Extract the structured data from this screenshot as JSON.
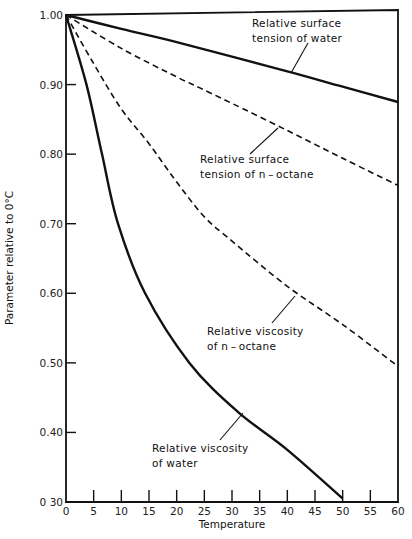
{
  "chart_data": {
    "type": "line",
    "title": "",
    "xlabel": "Temperature",
    "ylabel": "Parameter relative to 0°C",
    "xlim": [
      0,
      60
    ],
    "ylim": [
      0.3,
      1.0
    ],
    "grid": false,
    "legend": "none (curves labeled by inline annotations with leader lines)",
    "x_ticks": [
      "0",
      "5",
      "10",
      "15",
      "20",
      "25",
      "30",
      "35",
      "40",
      "45",
      "50",
      "55",
      "60"
    ],
    "y_ticks": [
      "1.00",
      "0.90",
      "0.80",
      "0.70",
      "0.60",
      "0.50",
      "0.40",
      "0 30"
    ],
    "series": [
      {
        "name": "Relative surface tension of water",
        "style": "solid",
        "x": [
          0,
          10,
          20,
          30,
          40,
          50,
          60
        ],
        "y": [
          1.0,
          0.98,
          0.961,
          0.94,
          0.919,
          0.897,
          0.875
        ]
      },
      {
        "name": "Relative surface tension of n-octane",
        "style": "dashed",
        "x": [
          0,
          10,
          20,
          24,
          30,
          40,
          50,
          60
        ],
        "y": [
          1.0,
          0.952,
          0.911,
          0.896,
          0.873,
          0.834,
          0.794,
          0.755
        ]
      },
      {
        "name": "Relative viscosity of n-octane",
        "style": "dashed",
        "x": [
          0,
          5,
          10,
          15,
          20,
          25,
          30,
          40,
          50,
          60
        ],
        "y": [
          1.0,
          0.93,
          0.865,
          0.815,
          0.76,
          0.71,
          0.675,
          0.61,
          0.555,
          0.495
        ]
      },
      {
        "name": "Relative viscosity of water",
        "style": "solid",
        "x": [
          0,
          3.7,
          6.5,
          9.4,
          14.3,
          22.3,
          31,
          40,
          50
        ],
        "y": [
          1.0,
          0.9,
          0.8,
          0.7,
          0.6,
          0.5,
          0.43,
          0.375,
          0.305
        ]
      }
    ],
    "annotations": [
      {
        "lines": [
          "Relative  surface",
          "tension  of  water"
        ],
        "target": "Relative surface tension of water"
      },
      {
        "lines": [
          "Relative  surface",
          "tension  of  n – octane"
        ],
        "target": "Relative surface tension of n-octane"
      },
      {
        "lines": [
          "Relative  viscosity",
          "of  n – octane"
        ],
        "target": "Relative viscosity of n-octane"
      },
      {
        "lines": [
          "Relative  viscosity",
          "of  water"
        ],
        "target": "Relative viscosity of water"
      }
    ]
  },
  "layout": {
    "plot": {
      "left": 66,
      "right": 398,
      "top": 15,
      "bottom": 502,
      "frame_top": 10
    },
    "line_color": "#111111"
  }
}
